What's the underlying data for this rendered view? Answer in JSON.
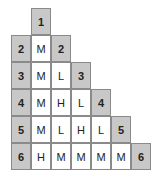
{
  "triangle": {
    "rows": [
      {
        "label": "1",
        "values": []
      },
      {
        "label": "2",
        "values": [
          "M"
        ]
      },
      {
        "label": "3",
        "values": [
          "M",
          "L"
        ]
      },
      {
        "label": "4",
        "values": [
          "M",
          "H",
          "L"
        ]
      },
      {
        "label": "5",
        "values": [
          "M",
          "L",
          "H",
          "L"
        ]
      },
      {
        "label": "6",
        "values": [
          "H",
          "M",
          "M",
          "M",
          "M"
        ]
      }
    ]
  }
}
